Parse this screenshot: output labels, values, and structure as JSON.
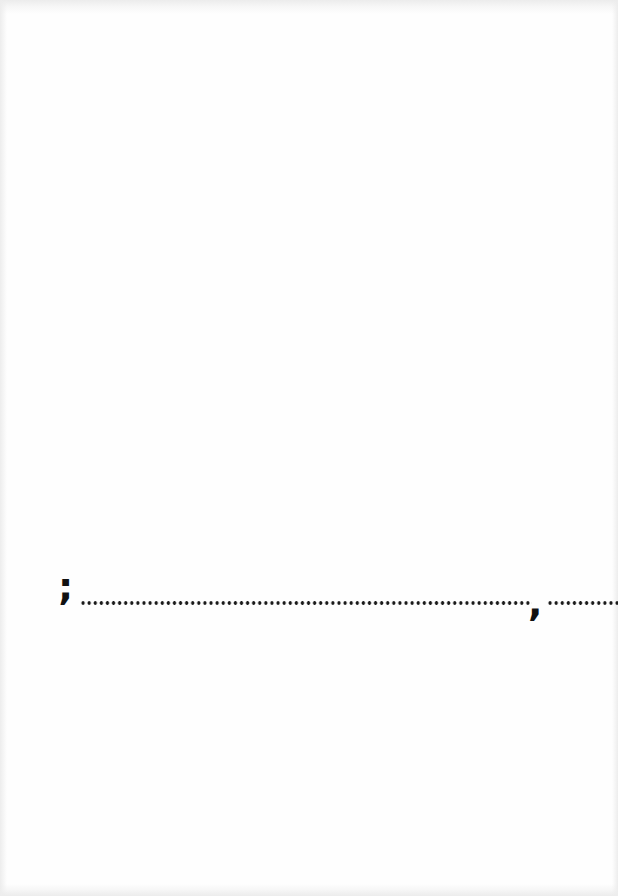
{
  "document": {
    "type": "scanned-page",
    "background_color": "#fefefe",
    "ink_color": "#111111",
    "fill_line": {
      "leading_mark": ";",
      "first_blank": "..........................................................................",
      "separator_mark": ",",
      "second_blank": "............"
    }
  }
}
